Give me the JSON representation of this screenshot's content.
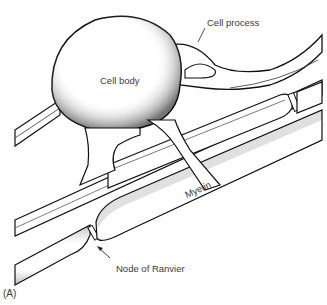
{
  "figure": {
    "panel_label": "(A)",
    "labels": {
      "cell_process": "Cell process",
      "cell_body": "Cell body",
      "myelin": "Myelin",
      "node_of_ranvier": "Node of Ranvier"
    },
    "colors": {
      "outline": "#111111",
      "stipple": "#555555",
      "fill": "#ffffff",
      "text": "#3a3a3a"
    }
  }
}
